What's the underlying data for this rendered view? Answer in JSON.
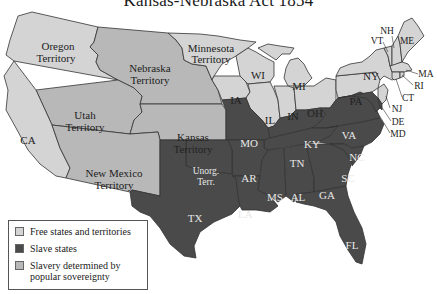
{
  "title": "Kansas-Nebraska Act 1854",
  "colors": {
    "free": "#d4d4d4",
    "slave": "#4a4a4a",
    "popular_sovereignty": "#b8b8b8",
    "border": "#333333"
  },
  "regions": {
    "oregon": "Oregon",
    "oregon2": "Territory",
    "nebraska": "Nebraska",
    "nebraska2": "Territory",
    "minnesota": "Minnesota",
    "minnesota2": "Territory",
    "utah": "Utah",
    "utah2": "Territory",
    "kansas": "Kansas",
    "kansas2": "Territory",
    "newmexico": "New Mexico",
    "newmexico2": "Territory",
    "ca": "CA",
    "wi": "WI",
    "mi": "MI",
    "ia": "IA",
    "il": "IL",
    "in": "IN",
    "oh": "OH",
    "pa": "PA",
    "ny": "NY",
    "nh": "NH",
    "vt": "VT",
    "me": "ME",
    "ma": "MA",
    "ri": "RI",
    "ct": "CT",
    "nj": "NJ",
    "de": "DE",
    "md": "MD",
    "mo": "MO",
    "ky": "KY",
    "va": "VA",
    "tn": "TN",
    "nc": "NC",
    "ar": "AR",
    "sc": "SC",
    "unorg": "Unorg.",
    "unorg2": "Terr.",
    "tx": "TX",
    "la": "LA",
    "ms": "MS",
    "al": "AL",
    "ga": "GA",
    "fl": "FL"
  },
  "legend": {
    "items": [
      {
        "label": "Free states and territories",
        "color": "#d4d4d4"
      },
      {
        "label": "Slave states",
        "color": "#4a4a4a"
      },
      {
        "label": "Slavery determined by popular sovereignty",
        "color": "#b8b8b8"
      }
    ],
    "item0": "Free states and territories",
    "item1": "Slave states",
    "item2a": "Slavery determined by",
    "item2b": "popular sovereignty"
  }
}
